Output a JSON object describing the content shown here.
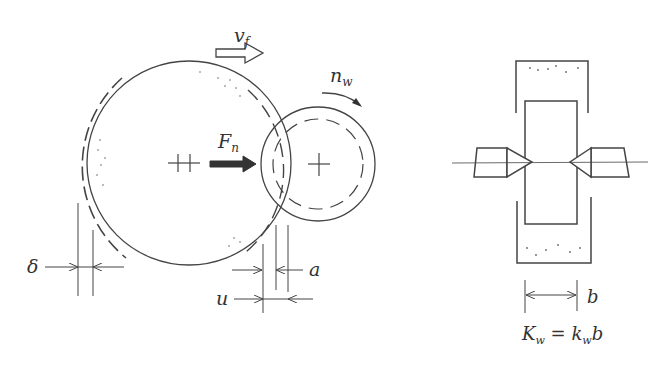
{
  "diagram": {
    "left_figure": {
      "description": "Grinding wheel and workpiece contact",
      "labels": {
        "feed_velocity": "v",
        "feed_velocity_sub": "f",
        "normal_force": "F",
        "normal_force_sub": "n",
        "workpiece_speed": "n",
        "workpiece_speed_sub": "w",
        "delta": "δ",
        "a": "a",
        "u": "u"
      }
    },
    "right_figure": {
      "description": "Workpiece between centers with wheel width",
      "labels": {
        "width": "b",
        "formula_lhs": "K",
        "formula_lhs_sub": "w",
        "formula_eq": " = ",
        "formula_rhs": "k",
        "formula_rhs_sub": "w",
        "formula_rhs_tail": "b"
      }
    },
    "colors": {
      "line": "#444444",
      "background": "#ffffff"
    }
  }
}
